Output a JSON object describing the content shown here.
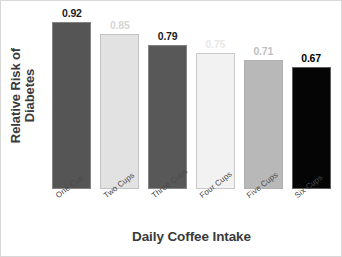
{
  "chart_data": {
    "type": "bar",
    "title": "",
    "xlabel": "Daily Coffee Intake",
    "ylabel_line1": "Relative Risk of",
    "ylabel_line2": "Diabetes",
    "ylabel": "Relative Risk of Diabetes",
    "categories": [
      "One Cup",
      "Two Cups",
      "Three Cups",
      "Four Cups",
      "Five Cups",
      "Six Cups"
    ],
    "values": [
      0.92,
      0.85,
      0.79,
      0.75,
      0.71,
      0.67
    ],
    "value_labels": [
      "0.92",
      "0.85",
      "0.79",
      "0.75",
      "0.71",
      "0.67"
    ],
    "bar_colors": [
      "#555555",
      "#e2e2e2",
      "#585858",
      "#f2f2f2",
      "#b8b8b8",
      "#050505"
    ],
    "label_colors": [
      "#1a1a1a",
      "#d6d6d6",
      "#1a1a1a",
      "#e8e8e8",
      "#c0c0c0",
      "#000000"
    ],
    "ylim": [
      0.0,
      1.0
    ],
    "grid": false,
    "legend": "none",
    "axis_lines": false,
    "tick_marks": false,
    "background_color": "#ffffff",
    "border_color": "#d8d8d8"
  }
}
